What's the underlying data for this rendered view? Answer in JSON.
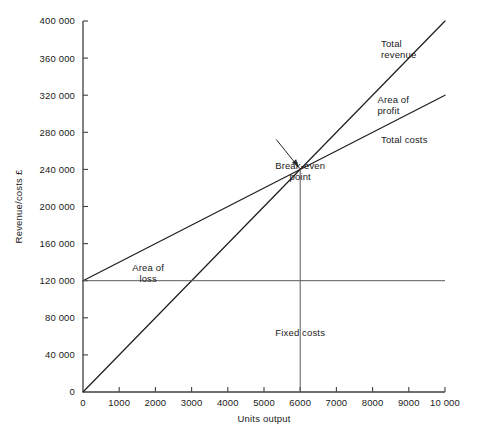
{
  "chart_data": {
    "type": "line",
    "title": "",
    "xlabel": "Units output",
    "ylabel": "Revenue/costs £",
    "xlim": [
      0,
      10000
    ],
    "ylim": [
      0,
      400000
    ],
    "grid": false,
    "legend_position": "inline-annotations",
    "x_ticks": [
      0,
      1000,
      2000,
      3000,
      4000,
      5000,
      6000,
      7000,
      8000,
      9000,
      10000
    ],
    "x_tick_labels": [
      "0",
      "1000",
      "2000",
      "3000",
      "4000",
      "5000",
      "6000",
      "7000",
      "8000",
      "9000",
      "10 000"
    ],
    "y_ticks": [
      0,
      40000,
      80000,
      120000,
      160000,
      200000,
      240000,
      280000,
      320000,
      360000,
      400000
    ],
    "y_tick_labels": [
      "0",
      "40 000",
      "80 000",
      "120 000",
      "160 000",
      "200 000",
      "240 000",
      "280 000",
      "320 000",
      "360 000",
      "400 000"
    ],
    "series": [
      {
        "name": "Total revenue",
        "x": [
          0,
          10000
        ],
        "values": [
          0,
          400000
        ]
      },
      {
        "name": "Total costs",
        "x": [
          0,
          10000
        ],
        "values": [
          120000,
          320000
        ]
      },
      {
        "name": "Fixed costs",
        "x": [
          0,
          10000
        ],
        "values": [
          120000,
          120000
        ]
      }
    ],
    "annotations": [
      {
        "name": "break-even-point",
        "label": "Break-even",
        "label2": "point",
        "x": 6000,
        "y": 240000
      },
      {
        "name": "total-revenue",
        "label": "Total",
        "label2": "revenue",
        "x": 9200,
        "y": 372000
      },
      {
        "name": "area-of-profit",
        "label": "Area of",
        "label2": "profit",
        "x": 9100,
        "y": 312000
      },
      {
        "name": "total-costs",
        "label": "Total costs",
        "x": 9200,
        "y": 268000
      },
      {
        "name": "area-of-loss",
        "label": "Area of",
        "label2": "loss",
        "x": 1800,
        "y": 130000
      },
      {
        "name": "fixed-costs",
        "label": "Fixed costs",
        "x": 6000,
        "y": 60000
      }
    ],
    "break_even": {
      "units": 6000,
      "value": 240000
    },
    "colors": {
      "background": "#ffffff",
      "line": "#1f1f1f",
      "axis": "#404040",
      "guide": "#5a5a5a",
      "text": "#1a1a1a"
    }
  }
}
